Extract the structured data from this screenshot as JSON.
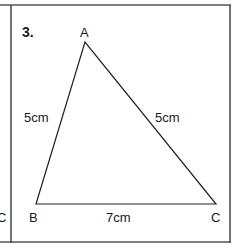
{
  "question_number": "3.",
  "neighbor_label_left": "C",
  "triangle": {
    "vertices": {
      "A": "A",
      "B": "B",
      "C": "C"
    },
    "sides": {
      "AB": "5cm",
      "AC": "5cm",
      "BC": "7cm"
    }
  },
  "colors": {
    "line": "#222222",
    "border": "#333333",
    "background": "#ffffff"
  }
}
